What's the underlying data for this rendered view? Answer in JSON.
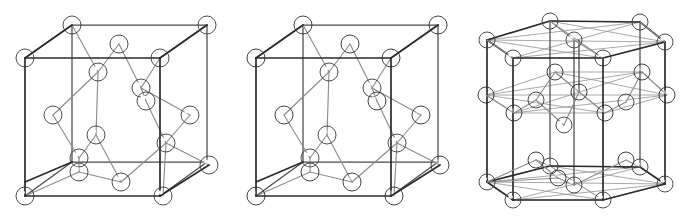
{
  "figure": {
    "background_color": "#ffffff",
    "panel_count": 3
  },
  "palette": {
    "atom_light_fill": "#e8e8e8",
    "atom_light_highlight": "#ffffff",
    "atom_light_shadow": "#8f8f8f",
    "atom_light_outline": "#3a3a3a",
    "atom_dark_fill": "#6a6a6a",
    "atom_dark_highlight": "#c8c8c8",
    "atom_dark_shadow": "#2e2e2e",
    "atom_dark_outline": "#262626",
    "cell_edge_front": "#2b2b2b",
    "cell_edge_back": "#4a4a4a",
    "bond_line": "#8d8d8d",
    "hex_guide_line": "#9a9a9a"
  },
  "panels": [
    {
      "id": "diamond",
      "name": "diamond-cubic-structure",
      "label": "Diamond cubic unit cell",
      "cell_shape": "cube",
      "atom_species": [
        "light"
      ],
      "atom_radius_px": 9,
      "atom_count": 18,
      "description": "Single-species diamond cubic lattice drawn as a cube with corner, face-centre and four interior tetrahedral atoms, all rendered as light grey spheres."
    },
    {
      "id": "zincblende",
      "name": "zincblende-structure",
      "label": "Zincblende unit cell",
      "cell_shape": "cube",
      "atom_species": [
        "dark",
        "light"
      ],
      "atom_radius_px": 9,
      "atom_count": 18,
      "description": "Two-species zincblende lattice: dark spheres occupy the face-centred cubic sites, light spheres occupy the four interior tetrahedral sites."
    },
    {
      "id": "wurtzite",
      "name": "wurtzite-hexagonal-structure",
      "label": "Wurtzite hexagonal cell",
      "cell_shape": "hexagonal-prism",
      "atom_species": [
        "light",
        "dark"
      ],
      "atom_radius_px": 8,
      "atom_count": 32,
      "description": "Hexagonal wurtzite cell drawn as a hexagonal prism with light spheres on the top and bottom hexagon layers and dark spheres forming the interior mid-height layer."
    }
  ],
  "geometry": {
    "cube": {
      "front_face": [
        [
          25,
          182
        ],
        [
          25,
          58
        ],
        [
          143,
          58
        ],
        [
          143,
          182
        ]
      ],
      "back_face": [
        [
          72,
          162
        ],
        [
          72,
          25
        ],
        [
          207,
          25
        ],
        [
          207,
          162
        ]
      ],
      "note": "front square offset to back square by (+47,-21)"
    },
    "hex_prism": {
      "top_hex": [
        [
          55,
          38
        ],
        [
          115,
          15
        ],
        [
          180,
          30
        ],
        [
          195,
          60
        ],
        [
          133,
          83
        ],
        [
          70,
          68
        ]
      ],
      "bottom_hex": [
        [
          55,
          168
        ],
        [
          115,
          145
        ],
        [
          180,
          160
        ],
        [
          195,
          190
        ],
        [
          133,
          213
        ],
        [
          70,
          198
        ]
      ],
      "note": "vertical prism height about 130 px"
    }
  },
  "atoms": {
    "diamond": [
      {
        "x": 72,
        "y": 25,
        "r": 9,
        "type": "light",
        "site": "corner-back-top-left"
      },
      {
        "x": 207,
        "y": 25,
        "r": 9,
        "type": "light",
        "site": "corner-back-top-right"
      },
      {
        "x": 25,
        "y": 58,
        "r": 9,
        "type": "light",
        "site": "corner-front-top-left"
      },
      {
        "x": 160,
        "y": 58,
        "r": 9,
        "type": "light",
        "site": "corner-front-top-right"
      },
      {
        "x": 119,
        "y": 44,
        "r": 9,
        "type": "light",
        "site": "face-top"
      },
      {
        "x": 98,
        "y": 72,
        "r": 9,
        "type": "light",
        "site": "tetra-1"
      },
      {
        "x": 141,
        "y": 88,
        "r": 9,
        "type": "light",
        "site": "tetra-2"
      },
      {
        "x": 146,
        "y": 101,
        "r": 9,
        "type": "light",
        "site": "face-right-upper"
      },
      {
        "x": 53,
        "y": 115,
        "r": 9,
        "type": "light",
        "site": "face-left"
      },
      {
        "x": 190,
        "y": 115,
        "r": 9,
        "type": "light",
        "site": "face-right"
      },
      {
        "x": 96,
        "y": 135,
        "r": 9,
        "type": "light",
        "site": "tetra-3"
      },
      {
        "x": 166,
        "y": 143,
        "r": 9,
        "type": "light",
        "site": "tetra-4"
      },
      {
        "x": 79,
        "y": 158,
        "r": 9,
        "type": "light",
        "site": "face-bottom-a"
      },
      {
        "x": 79,
        "y": 172,
        "r": 9,
        "type": "light",
        "site": "face-bottom-b"
      },
      {
        "x": 121,
        "y": 182,
        "r": 9,
        "type": "light",
        "site": "face-bottom-centre"
      },
      {
        "x": 25,
        "y": 196,
        "r": 9,
        "type": "light",
        "site": "corner-front-bottom-left"
      },
      {
        "x": 163,
        "y": 196,
        "r": 9,
        "type": "light",
        "site": "corner-front-bottom-right"
      },
      {
        "x": 209,
        "y": 165,
        "r": 9,
        "type": "light",
        "site": "corner-back-bottom-right"
      }
    ],
    "zincblende": [
      {
        "x": 72,
        "y": 25,
        "r": 9,
        "type": "dark",
        "site": "corner-back-top-left"
      },
      {
        "x": 207,
        "y": 25,
        "r": 9,
        "type": "dark",
        "site": "corner-back-top-right"
      },
      {
        "x": 25,
        "y": 58,
        "r": 9,
        "type": "dark",
        "site": "corner-front-top-left"
      },
      {
        "x": 160,
        "y": 58,
        "r": 9,
        "type": "dark",
        "site": "corner-front-top-right"
      },
      {
        "x": 119,
        "y": 44,
        "r": 9,
        "type": "dark",
        "site": "face-top"
      },
      {
        "x": 98,
        "y": 72,
        "r": 9,
        "type": "light",
        "site": "tetra-1"
      },
      {
        "x": 141,
        "y": 88,
        "r": 9,
        "type": "light",
        "site": "tetra-2"
      },
      {
        "x": 146,
        "y": 101,
        "r": 9,
        "type": "dark",
        "site": "face-right-upper"
      },
      {
        "x": 53,
        "y": 115,
        "r": 9,
        "type": "dark",
        "site": "face-left"
      },
      {
        "x": 190,
        "y": 115,
        "r": 9,
        "type": "dark",
        "site": "face-right"
      },
      {
        "x": 96,
        "y": 135,
        "r": 9,
        "type": "light",
        "site": "tetra-3"
      },
      {
        "x": 166,
        "y": 143,
        "r": 9,
        "type": "light",
        "site": "tetra-4"
      },
      {
        "x": 79,
        "y": 158,
        "r": 9,
        "type": "light",
        "site": "face-bottom-a"
      },
      {
        "x": 79,
        "y": 172,
        "r": 9,
        "type": "dark",
        "site": "face-bottom-b"
      },
      {
        "x": 121,
        "y": 182,
        "r": 9,
        "type": "dark",
        "site": "face-bottom-centre"
      },
      {
        "x": 25,
        "y": 196,
        "r": 9,
        "type": "dark",
        "site": "corner-front-bottom-left"
      },
      {
        "x": 163,
        "y": 196,
        "r": 9,
        "type": "dark",
        "site": "corner-front-bottom-right"
      },
      {
        "x": 209,
        "y": 165,
        "r": 9,
        "type": "dark",
        "site": "corner-back-bottom-right"
      }
    ],
    "wurtzite": [
      {
        "x": 88,
        "y": 21,
        "r": 8,
        "type": "light",
        "site": "top-back-centre"
      },
      {
        "x": 178,
        "y": 22,
        "r": 8,
        "type": "light",
        "site": "top-back-right"
      },
      {
        "x": 25,
        "y": 40,
        "r": 8,
        "type": "light",
        "site": "top-left"
      },
      {
        "x": 112,
        "y": 40,
        "r": 8,
        "type": "light",
        "site": "top-mid-a"
      },
      {
        "x": 203,
        "y": 42,
        "r": 8,
        "type": "light",
        "site": "top-right"
      },
      {
        "x": 51,
        "y": 58,
        "r": 8,
        "type": "light",
        "site": "top-front-left"
      },
      {
        "x": 141,
        "y": 58,
        "r": 8,
        "type": "light",
        "site": "top-front-centre"
      },
      {
        "x": 93,
        "y": 72,
        "r": 8,
        "type": "dark",
        "site": "mid-upper-left"
      },
      {
        "x": 180,
        "y": 72,
        "r": 8,
        "type": "dark",
        "site": "mid-upper-right"
      },
      {
        "x": 24,
        "y": 95,
        "r": 8,
        "type": "dark",
        "site": "mid-left"
      },
      {
        "x": 117,
        "y": 92,
        "r": 8,
        "type": "dark",
        "site": "mid-centre"
      },
      {
        "x": 205,
        "y": 95,
        "r": 8,
        "type": "dark",
        "site": "mid-right"
      },
      {
        "x": 74,
        "y": 100,
        "r": 8,
        "type": "light",
        "site": "mid-in-left"
      },
      {
        "x": 164,
        "y": 102,
        "r": 8,
        "type": "light",
        "site": "mid-in-right"
      },
      {
        "x": 52,
        "y": 113,
        "r": 8,
        "type": "dark",
        "site": "mid-front-left"
      },
      {
        "x": 143,
        "y": 113,
        "r": 8,
        "type": "dark",
        "site": "mid-front-centre"
      },
      {
        "x": 102,
        "y": 125,
        "r": 8,
        "type": "light",
        "site": "mid-low-centre"
      },
      {
        "x": 74,
        "y": 160,
        "r": 8,
        "type": "dark",
        "site": "bot-back-left-dark"
      },
      {
        "x": 164,
        "y": 160,
        "r": 8,
        "type": "dark",
        "site": "bot-back-right-dark"
      },
      {
        "x": 88,
        "y": 166,
        "r": 8,
        "type": "light",
        "site": "bot-back-left-light"
      },
      {
        "x": 178,
        "y": 167,
        "r": 8,
        "type": "light",
        "site": "bot-back-right-light"
      },
      {
        "x": 96,
        "y": 178,
        "r": 8,
        "type": "dark",
        "site": "bot-mid-dark"
      },
      {
        "x": 25,
        "y": 182,
        "r": 8,
        "type": "light",
        "site": "bot-left"
      },
      {
        "x": 112,
        "y": 185,
        "r": 8,
        "type": "light",
        "site": "bot-mid-light"
      },
      {
        "x": 203,
        "y": 184,
        "r": 8,
        "type": "light",
        "site": "bot-right"
      },
      {
        "x": 51,
        "y": 200,
        "r": 8,
        "type": "light",
        "site": "bot-front-left"
      },
      {
        "x": 141,
        "y": 200,
        "r": 8,
        "type": "light",
        "site": "bot-front-centre"
      }
    ]
  }
}
